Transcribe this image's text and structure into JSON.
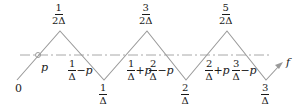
{
  "diagram": {
    "type": "triangle-wave",
    "line_color": "#9a9a9a",
    "dash_color": "#a8a8a8",
    "text_color": "#1a1a1a",
    "origin_label": "0",
    "curve_label": "f",
    "level_label": "p",
    "peaks": [
      {
        "num": "1",
        "den": "2Δ"
      },
      {
        "num": "3",
        "den": "2Δ"
      },
      {
        "num": "5",
        "den": "2Δ"
      }
    ],
    "troughs": [
      {
        "num": "1",
        "den": "Δ"
      },
      {
        "num": "2",
        "den": "Δ"
      },
      {
        "num": "3",
        "den": "Δ"
      }
    ],
    "crossings": [
      {
        "num": "1",
        "den": "Δ",
        "suffix": "−p"
      },
      {
        "num": "1",
        "den": "Δ",
        "suffix": "+p"
      },
      {
        "num": "2",
        "den": "Δ",
        "suffix": "−p"
      },
      {
        "num": "2",
        "den": "Δ",
        "suffix": "+p"
      },
      {
        "num": "3",
        "den": "Δ",
        "suffix": "−p"
      }
    ]
  }
}
